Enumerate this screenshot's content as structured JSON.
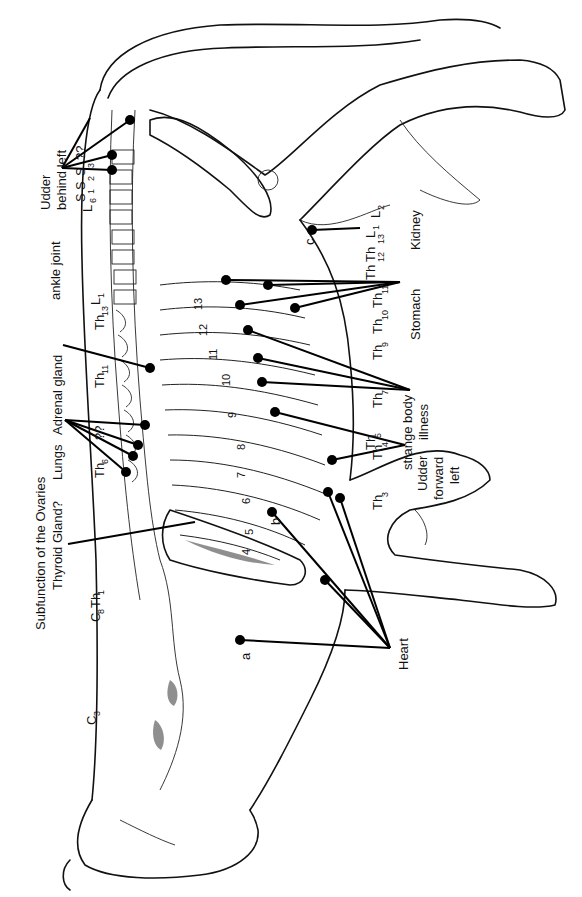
{
  "figure": {
    "orientation": "rotated 90° counter-clockwise (cow's back along left edge, head at bottom)"
  },
  "labels": {
    "udder_behind_left": [
      "Udder",
      "behind  left"
    ],
    "ankle_joint": "ankle joint",
    "adrenal_gland": "Adrenal gland",
    "lungs": "Lungs",
    "ovaries": "Subfunction of the Ovaries",
    "thyroid": "Thyroid Gland?",
    "kidney": "Kidney",
    "stomach": "Stomach",
    "strange_body_illness": [
      "strange body",
      "illness"
    ],
    "udder_forward_left": [
      "Udder",
      "forward",
      "left"
    ],
    "heart": "Heart"
  },
  "vertebra_labels_back": [
    {
      "main": "L",
      "sub": "6"
    },
    {
      "main": "S",
      "sub": "1"
    },
    {
      "main": "S",
      "sub": "2"
    },
    {
      "main": "S",
      "sub": "3"
    },
    {
      "main": "??"
    },
    {
      "main": "Th",
      "sub": "13"
    },
    {
      "main": "L",
      "sub": "1"
    },
    {
      "main": "Th",
      "sub": "11"
    },
    {
      "main": "Th",
      "sub": "6"
    },
    {
      "main": "??"
    },
    {
      "main": "C",
      "sub": "8"
    },
    {
      "main": "Th",
      "sub": "1"
    },
    {
      "main": "C",
      "sub": "3"
    }
  ],
  "vertebra_labels_belly": [
    {
      "main": "L",
      "sub": "2"
    },
    {
      "main": "L",
      "sub": "1"
    },
    {
      "main": "Th",
      "sub": "13"
    },
    {
      "main": "Th",
      "sub": "12"
    },
    {
      "main": "Th",
      "sub": "11"
    },
    {
      "main": "Th",
      "sub": "10"
    },
    {
      "main": "Th",
      "sub": "9"
    },
    {
      "main": "Th",
      "sub": "7"
    },
    {
      "main": "Th",
      "sub": "5"
    },
    {
      "main": "Th",
      "sub": "4"
    },
    {
      "main": "Th",
      "sub": "3"
    }
  ],
  "rib_numbers": [
    "13",
    "12",
    "11",
    "10",
    "9",
    "8",
    "7",
    "6",
    "5",
    "4"
  ],
  "point_letters": [
    "a",
    "b",
    "c"
  ],
  "text": {
    "udder1": "Udder",
    "udder2": "behind  left",
    "ankle": "ankle joint",
    "adrenal": "Adrenal gland",
    "lungs": "Lungs",
    "ovaries": "Subfunction of the Ovaries",
    "thyroid": "Thyroid Gland?",
    "kidney": "Kidney",
    "stomach": "Stomach",
    "strange1": "strange body",
    "strange2": "illness",
    "udderF1": "Udder",
    "udderF2": "forward",
    "udderF3": "left",
    "heart": "Heart",
    "qq": "??",
    "a": "a",
    "b": "b",
    "c": "c",
    "L": "L",
    "S": "S",
    "Th": "Th",
    "C": "C",
    "n1": "1",
    "n2": "2",
    "n3": "3",
    "n4": "4",
    "n5": "5",
    "n6": "6",
    "n7": "7",
    "n8": "8",
    "n9": "9",
    "n10": "10",
    "n11": "11",
    "n12": "12",
    "n13": "13"
  }
}
